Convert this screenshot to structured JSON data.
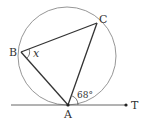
{
  "diagram": {
    "type": "geometry",
    "colors": {
      "circle": "#888888",
      "lines": "#333333",
      "text": "#333333"
    },
    "circle": {
      "cx": 67,
      "cy": 56,
      "r": 49
    },
    "points": {
      "A": {
        "label": "A",
        "x": 68,
        "y": 105
      },
      "B": {
        "label": "B",
        "x": 21,
        "y": 52
      },
      "C": {
        "label": "C",
        "x": 97,
        "y": 23
      },
      "T": {
        "label": "T",
        "x": 126,
        "y": 105
      }
    },
    "angles": {
      "CAT": {
        "label": "68°",
        "value": 68
      },
      "ABC": {
        "label": "x"
      }
    },
    "tangent_line": {
      "x1": 11,
      "y1": 105,
      "x2": 126,
      "y2": 105
    }
  }
}
